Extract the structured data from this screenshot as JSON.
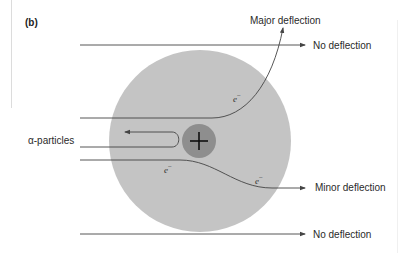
{
  "panel_label": "(b)",
  "labels": {
    "major": "Major deflection",
    "no_top": "No deflection",
    "minor": "Minor deflection",
    "no_bottom": "No deflection",
    "alpha": "α-particles"
  },
  "electron": {
    "symbol": "e",
    "charge": "−"
  },
  "nucleus_symbol": "+",
  "colors": {
    "atom": "#c4c4c4",
    "nucleus": "#8e8e8e",
    "line": "#444444",
    "text": "#2a2a2a"
  }
}
